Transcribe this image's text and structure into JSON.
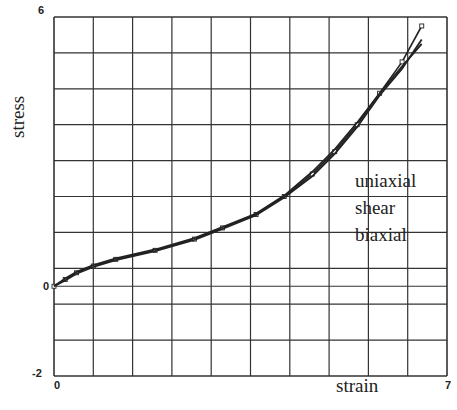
{
  "chart_data": {
    "type": "line",
    "title": "",
    "xlabel": "strain",
    "ylabel": "stress",
    "xlim": [
      0,
      7
    ],
    "ylim": [
      -2,
      6
    ],
    "x_tick_labels": [
      "0",
      "7"
    ],
    "y_tick_labels": [
      "6",
      "0",
      "-2"
    ],
    "grid": true,
    "grid_divisions": {
      "x": 10,
      "y": 10
    },
    "legend": [
      "uniaxial",
      "shear",
      "biaxial"
    ],
    "legend_position": "inside-right",
    "series": [
      {
        "name": "uniaxial",
        "marker": "square",
        "x": [
          0,
          0.2,
          0.4,
          0.7,
          1.1,
          1.8,
          2.5,
          3.0,
          3.6,
          4.1,
          4.6,
          5.0,
          5.4,
          5.8,
          6.2,
          6.55
        ],
        "y": [
          0,
          0.15,
          0.3,
          0.45,
          0.6,
          0.8,
          1.05,
          1.3,
          1.6,
          2.0,
          2.5,
          3.0,
          3.6,
          4.3,
          5.0,
          5.8
        ]
      },
      {
        "name": "shear",
        "marker": "none",
        "x": [
          0,
          0.2,
          0.4,
          0.7,
          1.1,
          1.8,
          2.5,
          3.0,
          3.6,
          4.1,
          4.6,
          5.0,
          5.4,
          5.8,
          6.2,
          6.55
        ],
        "y": [
          0,
          0.17,
          0.32,
          0.47,
          0.62,
          0.82,
          1.07,
          1.32,
          1.62,
          2.02,
          2.55,
          3.05,
          3.65,
          4.3,
          4.9,
          5.4
        ]
      },
      {
        "name": "biaxial",
        "marker": "none",
        "x": [
          0,
          0.2,
          0.4,
          0.7,
          1.1,
          1.8,
          2.5,
          3.0,
          3.6,
          4.1,
          4.6,
          5.0,
          5.4,
          5.8,
          6.2,
          6.55
        ],
        "y": [
          0,
          0.13,
          0.28,
          0.43,
          0.58,
          0.78,
          1.03,
          1.28,
          1.58,
          1.98,
          2.45,
          2.95,
          3.55,
          4.25,
          4.85,
          5.5
        ]
      }
    ]
  }
}
